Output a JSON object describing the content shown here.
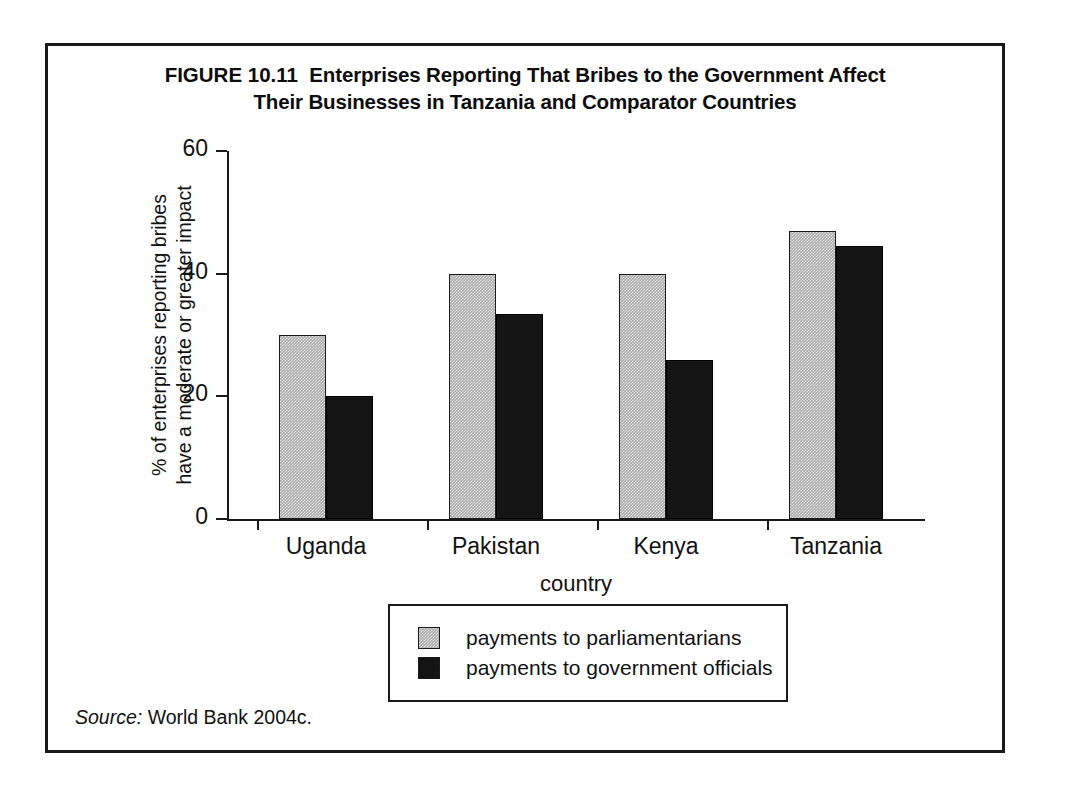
{
  "figure": {
    "label": "FIGURE 10.11",
    "title_line1": "Enterprises Reporting That Bribes to the Government Affect",
    "title_line2": "Their Businesses in Tanzania and Comparator Countries",
    "source_word": "Source:",
    "source_text": "World Bank 2004c."
  },
  "chart_data": {
    "type": "bar",
    "title": "Enterprises Reporting That Bribes to the Government Affect Their Businesses in Tanzania and Comparator Countries",
    "categories": [
      "Uganda",
      "Pakistan",
      "Kenya",
      "Tanzania"
    ],
    "series": [
      {
        "name": "payments to parliamentarians",
        "color": "#adadad",
        "values": [
          30,
          40,
          40,
          47
        ]
      },
      {
        "name": "payments to government officials",
        "color": "#141414",
        "values": [
          20,
          33.5,
          26,
          44.5
        ]
      }
    ],
    "xlabel": "country",
    "ylabel_line1": "% of enterprises reporting bribes",
    "ylabel_line2": "have a moderate or greater impact",
    "ylim": [
      0,
      60
    ],
    "yticks": [
      0,
      20,
      40,
      60
    ],
    "ytick_labels": [
      "0",
      "20",
      "40",
      "60"
    ],
    "grid": false,
    "legend_position": "bottom-center"
  }
}
